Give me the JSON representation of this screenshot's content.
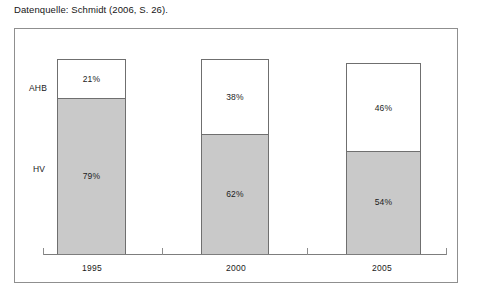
{
  "caption": "Datenquelle: Schmidt (2006, S. 26).",
  "series_labels": {
    "top": "AHB",
    "bottom": "HV"
  },
  "categories": [
    "1995",
    "2000",
    "2005"
  ],
  "bars": [
    {
      "category": "1995",
      "top_value": "21%",
      "bottom_value": "79%"
    },
    {
      "category": "2000",
      "top_value": "38%",
      "bottom_value": "62%"
    },
    {
      "category": "2005",
      "top_value": "46%",
      "bottom_value": "54%"
    }
  ],
  "colors": {
    "segment_top_fill": "#ffffff",
    "segment_bottom_fill": "#c9c9c9",
    "bar_outline": "#6f6f6f",
    "frame_border": "#8f8f8f",
    "axis_line": "#7d7d7d",
    "text": "#1a1a1a"
  },
  "chart_data": {
    "type": "bar",
    "title": "",
    "subtitle": "",
    "xlabel": "",
    "ylabel": "",
    "ylim": [
      0,
      100
    ],
    "grid": false,
    "legend_position": "left-inline",
    "stacked": true,
    "units": "percent",
    "categories": [
      "1995",
      "2000",
      "2005"
    ],
    "series": [
      {
        "name": "AHB",
        "values": [
          21,
          38,
          46
        ],
        "fill": "#ffffff"
      },
      {
        "name": "HV",
        "values": [
          79,
          62,
          54
        ],
        "fill": "#c9c9c9"
      }
    ],
    "data_labels": [
      "21%",
      "79%",
      "38%",
      "62%",
      "46%",
      "54%"
    ],
    "annotations": [
      "Datenquelle: Schmidt (2006, S. 26)."
    ]
  }
}
